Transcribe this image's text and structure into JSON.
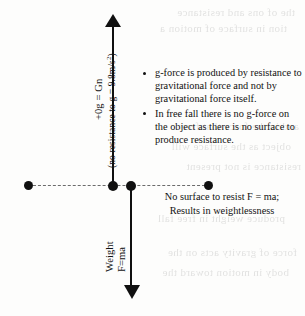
{
  "diagram": {
    "vertical_axis": {
      "label_main": "+0g = Gn",
      "label_sub": "(no resistance to g = 9.8m/s²)",
      "label_sub_text": "(no resistance to g = 9.8m/s",
      "label_sub_exponent": "2",
      "label_sub_tail": ")",
      "direction": "up"
    },
    "weight_axis": {
      "label_main": "Weight",
      "label_sub": "F=ma",
      "direction": "down"
    },
    "horizontal_axis": {
      "style": "dashed",
      "node_count": 4
    },
    "notes": [
      "g-force is produced by resistance to gravitational force and not by gravitational force itself.",
      "In free fall there is no g-force on the object as there is no surface to produce resistance."
    ],
    "caption_line_1": "No surface to resist F = ma;",
    "caption_line_2": "Results in weightlessness",
    "colors": {
      "ink": "#111111",
      "dashed_line": "#6b6b6b",
      "background": "#fdfdfc"
    }
  },
  "ghost_text": {
    "lines": [
      "the  of  ons  and  resistance",
      "tion  in  surface  of  motion  a",
      "and  in  the  force  that  free",
      "object  as  the  surface  will",
      "resistance  is  not  present",
      "produce  weight  in  free  fall",
      "force  of  gravity  acts  on  the",
      "body  in  motion  toward  the"
    ]
  }
}
